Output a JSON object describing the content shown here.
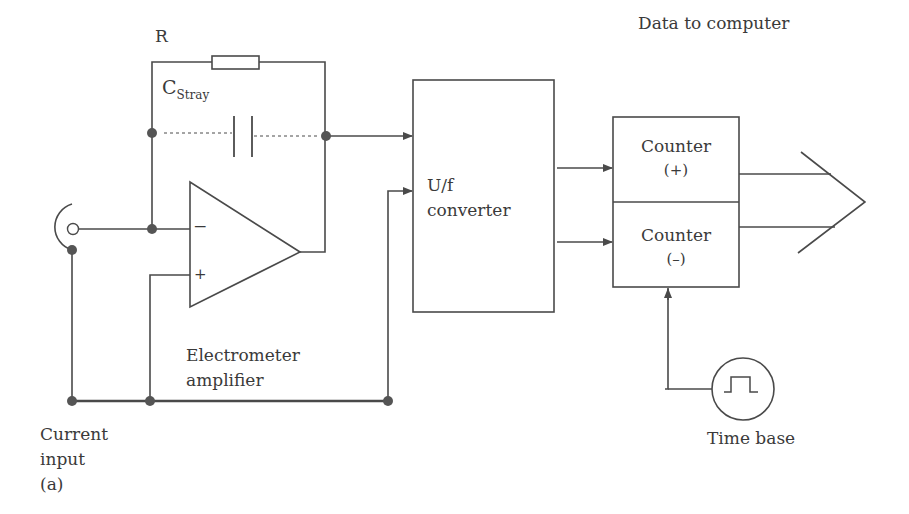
{
  "figure": {
    "type": "circuit-block-diagram",
    "colors": {
      "line": "#4a4a4a",
      "node": "#555555",
      "text": "#3a3a3a",
      "background": "#ffffff"
    }
  },
  "labels": {
    "resistor": "R",
    "stray_capacitor_main": "C",
    "stray_capacitor_sub": "Stray",
    "opamp_minus": "−",
    "opamp_plus": "+",
    "amplifier_line1": "Electrometer",
    "amplifier_line2": "amplifier",
    "converter_line1": "U/f",
    "converter_line2": "converter",
    "data_to_computer": "Data to computer",
    "counter_plus_line1": "Counter",
    "counter_plus_line2": "(+)",
    "counter_minus_line1": "Counter",
    "counter_minus_line2": "(–)",
    "time_base": "Time base",
    "current_input_line1": "Current",
    "current_input_line2": "input",
    "panel_tag": "(a)"
  },
  "components": [
    {
      "id": "input-connector",
      "name": "Current input connector"
    },
    {
      "id": "resistor",
      "name": "Feedback resistor R"
    },
    {
      "id": "stray-capacitor",
      "name": "Stray capacitance"
    },
    {
      "id": "opamp",
      "name": "Electrometer amplifier"
    },
    {
      "id": "uf-converter",
      "name": "U/f converter"
    },
    {
      "id": "counters",
      "name": "Counter (+) / Counter (−)"
    },
    {
      "id": "time-base",
      "name": "Time base"
    },
    {
      "id": "data-bus",
      "name": "Data to computer"
    }
  ]
}
